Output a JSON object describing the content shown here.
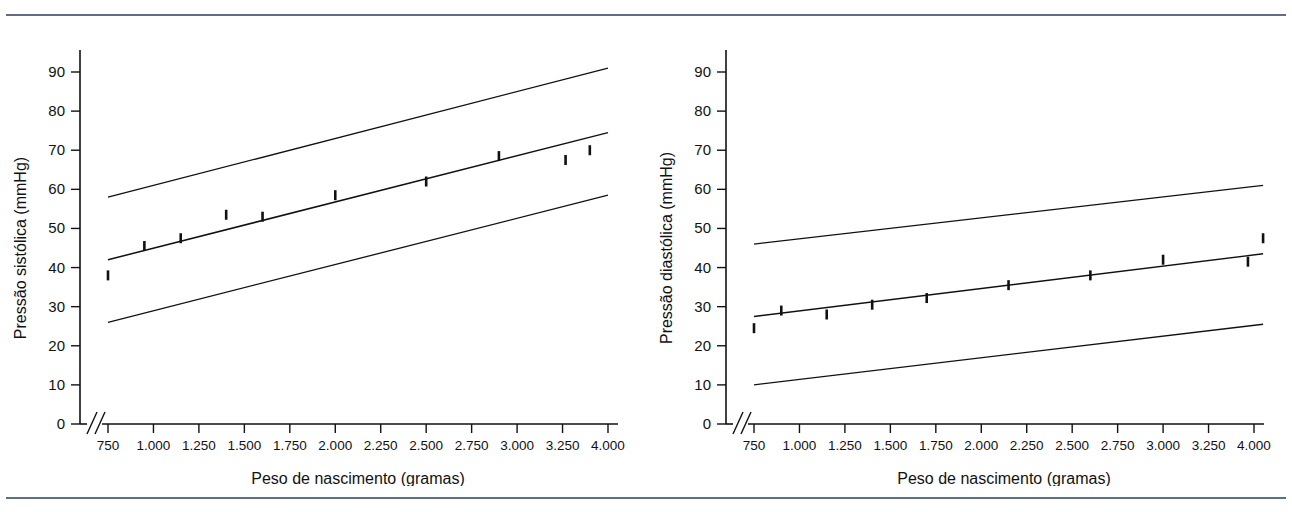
{
  "figure": {
    "background": "#ffffff",
    "line_color": "#111111",
    "rule_color": "#5c6f86",
    "panel_count": 2
  },
  "chart_data": [
    {
      "type": "scatter",
      "panel": "left",
      "title": "",
      "xlabel": "Peso de nascimento (gramas)",
      "ylabel": "Pressão sistólica (mmHg)",
      "xlim": [
        600,
        4150
      ],
      "ylim": [
        0,
        97
      ],
      "axis_break_x": true,
      "grid": false,
      "legend": "none",
      "ytick_labels": [
        "0",
        "10",
        "20",
        "30",
        "40",
        "50",
        "60",
        "70",
        "80",
        "90"
      ],
      "ytick_values": [
        0,
        10,
        20,
        30,
        40,
        50,
        60,
        70,
        80,
        90
      ],
      "xtick_labels": [
        "750",
        "1.000",
        "1.250",
        "1.500",
        "1.750",
        "2.000",
        "2.250",
        "2.500",
        "2.750",
        "3.000",
        "3.250",
        "4.000"
      ],
      "xtick_values": [
        750,
        1000,
        1250,
        1500,
        1750,
        2000,
        2250,
        2500,
        2750,
        3000,
        3250,
        4000
      ],
      "points": [
        {
          "x": 750,
          "y": 38.0
        },
        {
          "x": 950,
          "y": 45.5
        },
        {
          "x": 1150,
          "y": 47.5
        },
        {
          "x": 1400,
          "y": 53.5
        },
        {
          "x": 1600,
          "y": 53.0
        },
        {
          "x": 2000,
          "y": 58.5
        },
        {
          "x": 2500,
          "y": 62.0
        },
        {
          "x": 2900,
          "y": 68.5
        },
        {
          "x": 3300,
          "y": 67.5
        },
        {
          "x": 3700,
          "y": 70.0
        }
      ],
      "series": [
        {
          "name": "regressao",
          "x": [
            750,
            4000
          ],
          "values": [
            42.0,
            74.5
          ]
        },
        {
          "name": "ic-superior",
          "x": [
            750,
            4000
          ],
          "values": [
            58.0,
            91.0
          ]
        },
        {
          "name": "ic-inferior",
          "x": [
            750,
            4000
          ],
          "values": [
            26.0,
            58.5
          ]
        }
      ]
    },
    {
      "type": "scatter",
      "panel": "right",
      "title": "",
      "xlabel": "Peso de nascimento (gramas)",
      "ylabel": "Pressão diastólica (mmHg)",
      "xlim": [
        600,
        4150
      ],
      "ylim": [
        0,
        97
      ],
      "axis_break_x": true,
      "grid": false,
      "legend": "none",
      "ytick_labels": [
        "0",
        "10",
        "20",
        "30",
        "40",
        "50",
        "60",
        "70",
        "80",
        "90"
      ],
      "ytick_values": [
        0,
        10,
        20,
        30,
        40,
        50,
        60,
        70,
        80,
        90
      ],
      "xtick_labels": [
        "750",
        "1.000",
        "1.250",
        "1.500",
        "1.750",
        "2.000",
        "2.250",
        "2.500",
        "2.750",
        "3.000",
        "3.250",
        "4.000"
      ],
      "xtick_values": [
        750,
        1000,
        1250,
        1500,
        1750,
        2000,
        2250,
        2500,
        2750,
        3000,
        3250,
        4000
      ],
      "points": [
        {
          "x": 750,
          "y": 24.5
        },
        {
          "x": 900,
          "y": 29.0
        },
        {
          "x": 1150,
          "y": 28.0
        },
        {
          "x": 1400,
          "y": 30.5
        },
        {
          "x": 1700,
          "y": 32.2
        },
        {
          "x": 2150,
          "y": 35.5
        },
        {
          "x": 2600,
          "y": 38.0
        },
        {
          "x": 3000,
          "y": 42.0
        },
        {
          "x": 3900,
          "y": 41.5
        },
        {
          "x": 4150,
          "y": 47.5
        }
      ],
      "series": [
        {
          "name": "regressao",
          "x": [
            750,
            4150
          ],
          "values": [
            27.5,
            43.5
          ]
        },
        {
          "name": "ic-superior",
          "x": [
            750,
            4150
          ],
          "values": [
            46.0,
            61.0
          ]
        },
        {
          "name": "ic-inferior",
          "x": [
            750,
            4150
          ],
          "values": [
            10.0,
            25.5
          ]
        }
      ]
    }
  ]
}
